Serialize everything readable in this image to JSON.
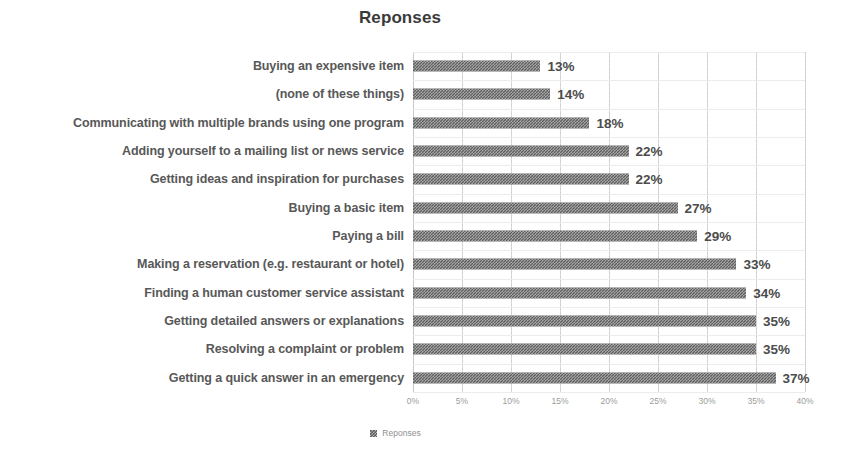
{
  "chart_data": {
    "type": "bar",
    "orientation": "horizontal",
    "title": "Reponses",
    "xlabel": "",
    "ylabel": "",
    "xlim": [
      0,
      40
    ],
    "xtick_labels": [
      "0%",
      "5%",
      "10%",
      "15%",
      "20%",
      "25%",
      "30%",
      "35%",
      "40%"
    ],
    "xticks": [
      0,
      5,
      10,
      15,
      20,
      25,
      30,
      35,
      40
    ],
    "grid": true,
    "legend": [
      "Reponses"
    ],
    "legend_position": "bottom",
    "bar_color": "#5e5e5e",
    "categories": [
      "Buying an expensive item",
      "(none of these things)",
      "Communicating with multiple brands using one program",
      "Adding yourself to a mailing list or news service",
      "Getting ideas and inspiration for purchases",
      "Buying a basic item",
      "Paying a bill",
      "Making a reservation (e.g. restaurant or hotel)",
      "Finding a human customer service assistant",
      "Getting detailed answers or explanations",
      "Resolving a complaint or problem",
      "Getting a quick answer in an emergency"
    ],
    "values": [
      13,
      14,
      18,
      22,
      22,
      27,
      29,
      33,
      34,
      35,
      35,
      37
    ],
    "value_labels": [
      "13%",
      "14%",
      "18%",
      "22%",
      "22%",
      "27%",
      "29%",
      "33%",
      "34%",
      "35%",
      "35%",
      "37%"
    ]
  }
}
